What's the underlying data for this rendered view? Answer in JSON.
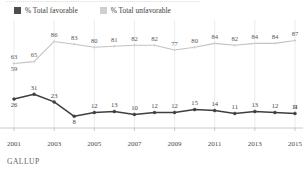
{
  "clipped_headline": "…………………………………………………………………………………",
  "legend": {
    "items": [
      {
        "label": "% Total favorable",
        "color": "#4d4d4d",
        "swatch_name": "legend-swatch-favorable"
      },
      {
        "label": "% Total unfavorable",
        "color": "#cfcfcf",
        "swatch_name": "legend-swatch-unfavorable"
      }
    ]
  },
  "source": "GALLUP",
  "chart_data": {
    "type": "line",
    "title": "",
    "xlabel": "",
    "ylabel": "",
    "grid": "vertical",
    "legend_position": "top-left",
    "ylim": [
      0,
      100
    ],
    "xlim": [
      2001,
      2015
    ],
    "x": [
      2001,
      2002,
      2003,
      2004,
      2005,
      2006,
      2007,
      2008,
      2009,
      2010,
      2011,
      2012,
      2013,
      2014,
      2015
    ],
    "tick_labels": [
      "2001",
      "2003",
      "2005",
      "2007",
      "2009",
      "2011",
      "2013",
      "2015"
    ],
    "tick_values": [
      2001,
      2003,
      2005,
      2007,
      2009,
      2011,
      2013,
      2015
    ],
    "series": [
      {
        "name": "% Total unfavorable",
        "color": "#c2c2c2",
        "values": [
          63,
          65,
          86,
          83,
          80,
          81,
          82,
          82,
          77,
          80,
          84,
          82,
          84,
          84,
          87
        ],
        "labels": [
          "63",
          "65",
          "86",
          "83",
          "80",
          "81",
          "82",
          "82",
          "77",
          "80",
          "84",
          "82",
          "84",
          "84",
          "87"
        ],
        "extra_labels": [
          {
            "index": 0,
            "text": "59",
            "value": 59,
            "position": "below"
          }
        ]
      },
      {
        "name": "% Total favorable",
        "color": "#3f3f3f",
        "values": [
          26,
          31,
          23,
          8,
          12,
          13,
          10,
          12,
          12,
          15,
          14,
          11,
          13,
          12,
          11
        ],
        "labels": [
          "",
          "31",
          "23",
          "",
          "12",
          "13",
          "10",
          "12",
          "12",
          "15",
          "14",
          "11",
          "13",
          "12",
          "11"
        ],
        "extra_labels": [
          {
            "index": 0,
            "text": "26",
            "value": 26,
            "position": "below"
          },
          {
            "index": 3,
            "text": "8",
            "value": 8,
            "position": "below"
          },
          {
            "index": 14,
            "text": "9",
            "value": 9,
            "position": "end"
          }
        ]
      }
    ]
  }
}
